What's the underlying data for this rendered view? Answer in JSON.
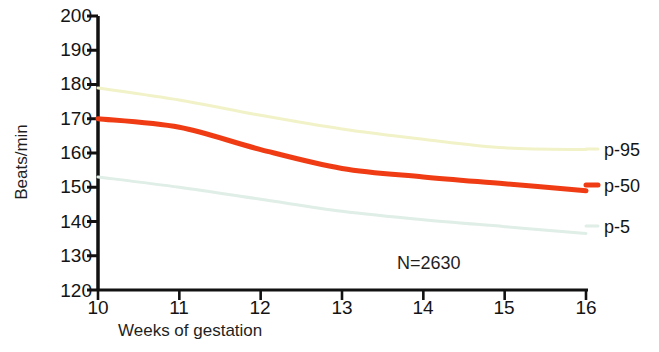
{
  "chart_data": {
    "type": "line",
    "title": "",
    "xlabel": "Weeks of gestation",
    "ylabel": "Beats/min",
    "xlim": [
      10,
      16
    ],
    "ylim": [
      120,
      200
    ],
    "xticks": [
      "10",
      "11",
      "12",
      "13",
      "14",
      "15",
      "16"
    ],
    "yticks": [
      "200",
      "190",
      "180",
      "170",
      "160",
      "150",
      "140",
      "130",
      "120"
    ],
    "grid": false,
    "legend_position": "right",
    "x": [
      10,
      11,
      12,
      13,
      14,
      15,
      16
    ],
    "series": [
      {
        "name": "p-95",
        "color": "#f2f2c8",
        "width": 3,
        "values": [
          179,
          175.5,
          171,
          167,
          164,
          161.5,
          161
        ]
      },
      {
        "name": "p-50",
        "color": "#f03c14",
        "width": 5,
        "values": [
          170,
          167.5,
          161,
          155.5,
          153,
          151,
          149
        ]
      },
      {
        "name": "p-5",
        "color": "#dfeee6",
        "width": 3,
        "values": [
          153,
          150,
          146.5,
          143,
          140.5,
          138.5,
          136.5
        ]
      }
    ],
    "annotations": [
      {
        "text": "N=2630",
        "x": 13.45,
        "y": 126.5
      }
    ]
  },
  "legend": {
    "entries": [
      {
        "label": "p-95",
        "color": "#f2f2c8"
      },
      {
        "label": "p-50",
        "color": "#f03c14"
      },
      {
        "label": "p-5",
        "color": "#dfeee6"
      }
    ]
  },
  "axis": {
    "y_title": "Beats/min",
    "x_title": "Weeks of gestation"
  }
}
